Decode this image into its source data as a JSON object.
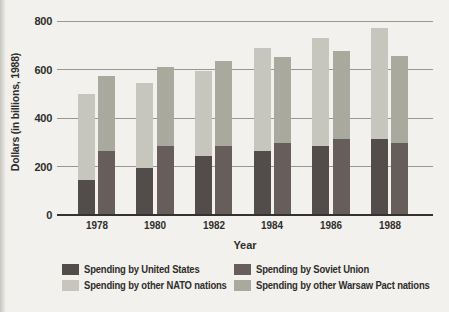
{
  "chart_data": {
    "type": "bar",
    "stacked": true,
    "title": "",
    "xlabel": "Year",
    "ylabel": "Dollars (in billions, 1988)",
    "ylim": [
      0,
      800
    ],
    "yticks": [
      0,
      200,
      400,
      600,
      800
    ],
    "grid": true,
    "legend_position": "bottom",
    "categories": [
      "1978",
      "1980",
      "1982",
      "1984",
      "1986",
      "1988"
    ],
    "groups": [
      {
        "name": "NATO",
        "segments": [
          {
            "series": "Spending by United States",
            "color": "#524c4b",
            "values": [
              145,
              195,
              245,
              265,
              285,
              315
            ]
          },
          {
            "series": "Spending by other NATO nations",
            "color": "#c7c6bc",
            "values": [
              355,
              350,
              350,
              425,
              445,
              455
            ]
          }
        ],
        "totals": [
          500,
          545,
          595,
          690,
          730,
          770
        ]
      },
      {
        "name": "Warsaw Pact",
        "segments": [
          {
            "series": "Spending by Soviet Union",
            "color": "#675d5a",
            "values": [
              265,
              285,
              285,
              295,
              315,
              295
            ]
          },
          {
            "series": "Spending by other Warsaw Pact nations",
            "color": "#aaa99e",
            "values": [
              310,
              325,
              350,
              355,
              360,
              360
            ]
          }
        ],
        "totals": [
          575,
          610,
          635,
          650,
          675,
          655
        ]
      }
    ],
    "legend": [
      {
        "label": "Spending by United States",
        "color": "#524c4b"
      },
      {
        "label": "Spending by Soviet Union",
        "color": "#675d5a"
      },
      {
        "label": "Spending by other NATO nations",
        "color": "#c7c6bc"
      },
      {
        "label": "Spending by other Warsaw Pact nations",
        "color": "#aaa99e"
      }
    ],
    "colors": {
      "background": "#f2f1ed",
      "gridline": "#98978f",
      "axis_line": "#343230",
      "text": "#2f2d2a"
    }
  }
}
